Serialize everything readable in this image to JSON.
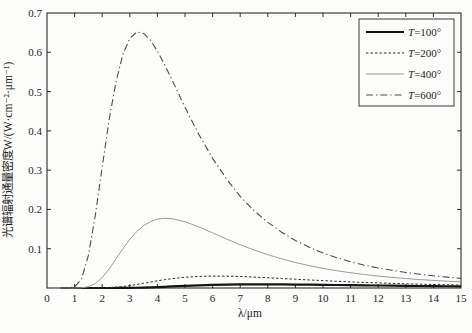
{
  "figure": {
    "background": "#fcfcfa",
    "frame_color": "#2b2b2b",
    "text_color": "#1c1c1c"
  },
  "chart_data": {
    "type": "line",
    "title": "",
    "xlabel": "λ/μm",
    "ylabel": "光谱辐射通量密度W/(W·cm⁻²·μm⁻¹)",
    "xlim": [
      0,
      15
    ],
    "ylim": [
      0,
      0.7
    ],
    "xticks": [
      0,
      1,
      2,
      3,
      4,
      5,
      6,
      7,
      8,
      9,
      10,
      11,
      12,
      13,
      14,
      15
    ],
    "yticks": [
      0.1,
      0.2,
      0.3,
      0.4,
      0.5,
      0.6,
      0.7
    ],
    "grid": false,
    "legend_position": "top-right",
    "x": [
      0.5,
      0.75,
      1,
      1.25,
      1.5,
      1.75,
      2,
      2.25,
      2.5,
      2.75,
      3,
      3.25,
      3.5,
      3.75,
      4,
      4.25,
      4.5,
      5,
      5.5,
      6,
      6.5,
      7,
      7.5,
      8,
      8.5,
      9,
      9.5,
      10,
      10.5,
      11,
      11.5,
      12,
      12.5,
      13,
      13.5,
      14,
      14.5,
      15
    ],
    "series": [
      {
        "name": "T=100°",
        "color": "#141414",
        "width": 2.2,
        "dash": "none",
        "values": [
          0,
          0,
          0,
          0,
          0,
          0,
          0,
          0,
          0.0001,
          0.0002,
          0.0004,
          0.0007,
          0.0012,
          0.0017,
          0.0024,
          0.0031,
          0.0039,
          0.0053,
          0.0067,
          0.0078,
          0.0086,
          0.0091,
          0.0093,
          0.0093,
          0.0091,
          0.0088,
          0.0085,
          0.0081,
          0.0076,
          0.0072,
          0.0067,
          0.0063,
          0.0059,
          0.0055,
          0.0051,
          0.0047,
          0.0044,
          0.0041
        ]
      },
      {
        "name": "T=200°",
        "color": "#2e2e2e",
        "width": 1,
        "dash": "2.5 2",
        "values": [
          0,
          0,
          0,
          0,
          0,
          0.0001,
          0.0003,
          0.0009,
          0.002,
          0.0037,
          0.0061,
          0.0089,
          0.012,
          0.0152,
          0.0182,
          0.021,
          0.0235,
          0.0273,
          0.0296,
          0.0304,
          0.0302,
          0.0293,
          0.0278,
          0.0261,
          0.0242,
          0.0223,
          0.0205,
          0.0188,
          0.0171,
          0.0156,
          0.0142,
          0.0129,
          0.0118,
          0.0107,
          0.0098,
          0.0089,
          0.0082,
          0.0075
        ]
      },
      {
        "name": "T=400°",
        "color": "#9a9a9a",
        "width": 1,
        "dash": "none",
        "values": [
          0,
          0,
          0,
          0.0005,
          0.0032,
          0.0113,
          0.0267,
          0.0485,
          0.0739,
          0.1,
          0.124,
          0.1436,
          0.1587,
          0.169,
          0.1752,
          0.1774,
          0.1768,
          0.1687,
          0.1556,
          0.1404,
          0.1249,
          0.1102,
          0.0967,
          0.0848,
          0.0742,
          0.065,
          0.0569,
          0.05,
          0.044,
          0.0388,
          0.0343,
          0.0304,
          0.027,
          0.0241,
          0.0215,
          0.0193,
          0.0173,
          0.0156
        ]
      },
      {
        "name": "T=600°",
        "color": "#4d4d4d",
        "width": 1.1,
        "dash": "7 3 1.3 3",
        "values": [
          0,
          0,
          0.0026,
          0.023,
          0.0829,
          0.185,
          0.308,
          0.428,
          0.525,
          0.595,
          0.635,
          0.652,
          0.648,
          0.631,
          0.603,
          0.57,
          0.534,
          0.46,
          0.391,
          0.33,
          0.278,
          0.233,
          0.197,
          0.167,
          0.142,
          0.121,
          0.104,
          0.089,
          0.077,
          0.067,
          0.058,
          0.051,
          0.045,
          0.0395,
          0.035,
          0.031,
          0.0276,
          0.0246
        ]
      }
    ]
  }
}
